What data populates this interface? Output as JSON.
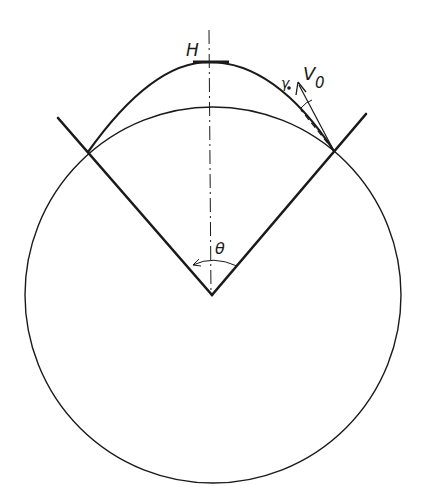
{
  "diagram": {
    "title": "",
    "labels": {
      "apex_height": "H",
      "launch_velocity": "V",
      "launch_velocity_subscript": "0",
      "launch_angle": "γ",
      "cone_angle": "θ"
    },
    "colors": {
      "ink": "#1a1a1a",
      "background": "#ffffff"
    },
    "geometry": {
      "circle": {
        "cx": 212,
        "cy": 295,
        "r": 188
      },
      "cone_apex": [
        212,
        295
      ],
      "left_arm_end": [
        58,
        118
      ],
      "right_arm_end": [
        366,
        114
      ],
      "left_intersection": [
        88,
        152
      ],
      "right_intersection": [
        334,
        151
      ],
      "trajectory_apex": [
        209,
        62
      ],
      "axis": {
        "x": 209,
        "y_top": 30,
        "y_bottom": 295
      }
    }
  }
}
